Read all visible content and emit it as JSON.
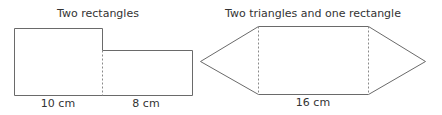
{
  "diagram1": {
    "title": "Two rectangles",
    "label_left": "10 cm",
    "label_right": "8 cm"
  },
  "diagram2": {
    "title": "Two triangles and one rectangle",
    "label_bottom": "16 cm"
  },
  "colors": {
    "stroke": "#6a6a6a",
    "dashed": "#8a8a8a",
    "text": "#333333"
  }
}
